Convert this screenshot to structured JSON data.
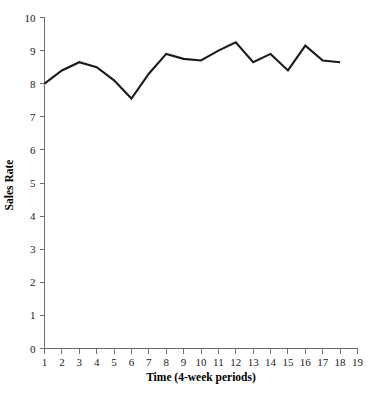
{
  "chart_data": {
    "type": "line",
    "title": "",
    "xlabel": "Time (4-week periods)",
    "ylabel": "Sales Rate",
    "x": [
      1,
      2,
      3,
      4,
      5,
      6,
      7,
      8,
      9,
      10,
      11,
      12,
      13,
      14,
      15,
      16,
      17,
      18
    ],
    "values": [
      8.0,
      8.4,
      8.65,
      8.5,
      8.1,
      7.55,
      8.3,
      8.9,
      8.75,
      8.7,
      9.0,
      9.25,
      8.65,
      8.9,
      8.4,
      9.15,
      8.7,
      8.65
    ],
    "series": [
      {
        "name": "Sales Rate",
        "values": [
          8.0,
          8.4,
          8.65,
          8.5,
          8.1,
          7.55,
          8.3,
          8.9,
          8.75,
          8.7,
          9.0,
          9.25,
          8.65,
          8.9,
          8.4,
          9.15,
          8.7,
          8.65
        ]
      }
    ],
    "xlim": [
      1,
      19
    ],
    "ylim": [
      0,
      10
    ],
    "xticks": [
      1,
      2,
      3,
      4,
      5,
      6,
      7,
      8,
      9,
      10,
      11,
      12,
      13,
      14,
      15,
      16,
      17,
      18,
      19
    ],
    "yticks": [
      0,
      1,
      2,
      3,
      4,
      5,
      6,
      7,
      8,
      9,
      10
    ],
    "xtick_labels": [
      "1",
      "2",
      "3",
      "4",
      "5",
      "6",
      "7",
      "8",
      "9",
      "10",
      "11",
      "12",
      "13",
      "14",
      "15",
      "16",
      "17",
      "18",
      "19"
    ],
    "ytick_labels": [
      "0",
      "1",
      "2",
      "3",
      "4",
      "5",
      "6",
      "7",
      "8",
      "9",
      "10"
    ],
    "grid": false,
    "legend": false,
    "legend_position": "none",
    "line_color": "#1a1a1a",
    "axis_color": "#6e6e6e",
    "background_color": "#ffffff"
  }
}
